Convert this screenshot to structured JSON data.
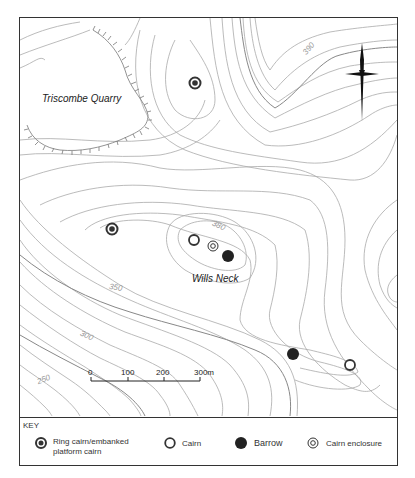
{
  "map": {
    "places": {
      "quarry": "Triscombe Quarry",
      "summit": "Wills Neck"
    },
    "contour_labels": {
      "c390": "390",
      "c380": "380",
      "c350": "350",
      "c300": "300",
      "c250": "250"
    },
    "scale_bar": {
      "ticks": [
        "0",
        "100",
        "200",
        "300m"
      ]
    },
    "north_arrow": "north-arrow",
    "features": [
      {
        "type": "ring-cairn",
        "x": 195,
        "y": 83
      },
      {
        "type": "ring-cairn",
        "x": 112,
        "y": 229
      },
      {
        "type": "cairn",
        "x": 194,
        "y": 240
      },
      {
        "type": "cairn-enclosure",
        "x": 213,
        "y": 246
      },
      {
        "type": "barrow",
        "x": 228,
        "y": 256
      },
      {
        "type": "barrow",
        "x": 293,
        "y": 354
      },
      {
        "type": "cairn",
        "x": 350,
        "y": 365
      }
    ]
  },
  "key": {
    "title": "KEY",
    "items": [
      {
        "symbol": "ring-cairn",
        "label_line1": "Ring cairn/embanked",
        "label_line2": "platform cairn"
      },
      {
        "symbol": "cairn",
        "label": "Cairn"
      },
      {
        "symbol": "barrow",
        "label": "Barrow"
      },
      {
        "symbol": "cairn-enclosure",
        "label": "Cairn enclosure"
      }
    ]
  }
}
